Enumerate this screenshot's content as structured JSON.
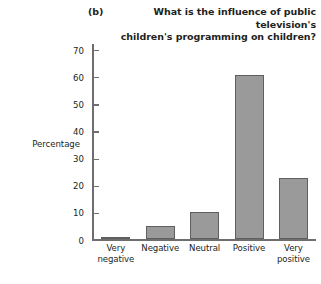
{
  "chart_data": {
    "type": "bar",
    "panel_label": "(b)",
    "title": "What is the influence of public television's children's programming on children?",
    "title_line_1": "What is the influence of public television's",
    "title_line_2": "children's programming on children?",
    "xlabel": "",
    "ylabel": "Percentage",
    "categories": [
      "Very\nnegative",
      "Negative",
      "Neutral",
      "Positive",
      "Very\npositive"
    ],
    "category_names": [
      "Very negative",
      "Negative",
      "Neutral",
      "Positive",
      "Very positive"
    ],
    "values": [
      1,
      5,
      10,
      60.5,
      22.5
    ],
    "ylim": [
      0,
      70
    ],
    "yticks": [
      0,
      10,
      20,
      30,
      40,
      50,
      60,
      70
    ],
    "ytick_labels": [
      "0",
      "10",
      "20",
      "30",
      "40",
      "50",
      "60",
      "70"
    ],
    "grid": false,
    "legend": null,
    "bar_fill_color": "#9a9a9a",
    "bar_edge_color": "#5f5f5f",
    "axis_color": "#6e6e6e",
    "text_color": "#231f20",
    "background_color": "#ffffff"
  }
}
